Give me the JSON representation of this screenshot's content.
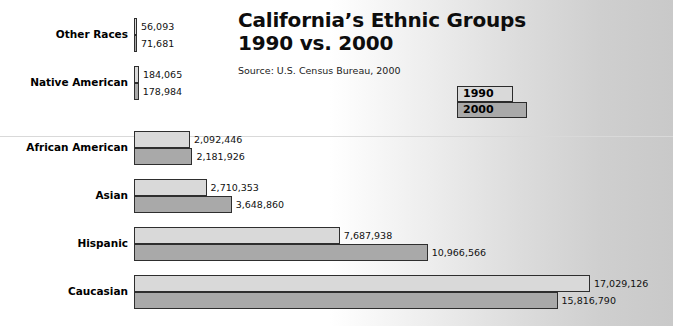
{
  "title": {
    "line1": "California’s Ethnic Groups",
    "line2": "1990 vs. 2000"
  },
  "source": "Source:  U.S. Census Bureau, 2000",
  "legend": {
    "items": [
      {
        "label": "1990"
      },
      {
        "label": "2000"
      }
    ]
  },
  "colors": {
    "series_1990": "#d9d9d9",
    "series_2000": "#a9a9a9",
    "bar_outline": "#2e2e2e",
    "background_left": "#ffffff",
    "background_right": "#c9c9c9",
    "text": "#000000"
  },
  "chart_data": {
    "type": "bar",
    "orientation": "horizontal",
    "title": "California’s Ethnic Groups 1990 vs. 2000",
    "subtitle": "Source:  U.S. Census Bureau, 2000",
    "xlabel": "",
    "ylabel": "",
    "grid": false,
    "legend_position": "top-right",
    "xlim": [
      0,
      17029126
    ],
    "categories": [
      "Other Races",
      "Native American",
      "African American",
      "Asian",
      "Hispanic",
      "Caucasian"
    ],
    "series": [
      {
        "name": "1990",
        "values": [
          56093,
          184065,
          2092446,
          2710353,
          7687938,
          17029126
        ],
        "labels": [
          "56,093",
          "184,065",
          "2,092,446",
          "2,710,353",
          "7,687,938",
          "17,029,126"
        ]
      },
      {
        "name": "2000",
        "values": [
          71681,
          178984,
          2181926,
          3648860,
          10966566,
          15816790
        ],
        "labels": [
          "71,681",
          "178,984",
          "2,181,926",
          "3,648,860",
          "10,966,566",
          "15,816,790"
        ]
      }
    ]
  }
}
